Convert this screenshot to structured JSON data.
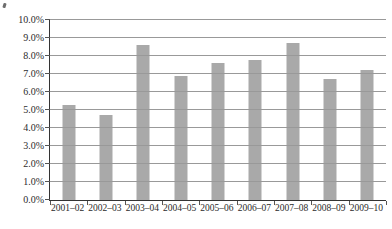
{
  "chart_data": {
    "type": "bar",
    "title": "",
    "xlabel": "",
    "ylabel": "",
    "categories": [
      "2001–02",
      "2002–03",
      "2003–04",
      "2004–05",
      "2005–06",
      "2006–07",
      "2007–08",
      "2008–09",
      "2009–10"
    ],
    "values": [
      5.3,
      4.7,
      8.6,
      6.9,
      7.6,
      7.8,
      8.7,
      6.7,
      7.2
    ],
    "ylim": [
      0,
      10
    ],
    "ytick_step": 1,
    "ytick_labels": [
      "0.0%",
      "1.0%",
      "2.0%",
      "3.0%",
      "4.0%",
      "5.0%",
      "6.0%",
      "7.0%",
      "8.0%",
      "9.0%",
      "10.0%"
    ],
    "grid": true,
    "legend": false,
    "gridlines_over_bars": true,
    "colors": {
      "bar": "#a9a9a9",
      "gridline": "#999999",
      "axis": "#333333",
      "tick": "#555555",
      "text": "#2b2b2b",
      "background": "#ffffff"
    }
  }
}
